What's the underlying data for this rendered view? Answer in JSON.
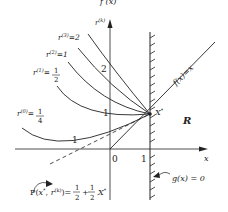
{
  "figure": {
    "top_caption_fragment": "f (x)",
    "axes": {
      "y_label": "r(k)",
      "x_label": "x",
      "origin_label": "0",
      "x_tick_1": "1"
    },
    "curves": [
      {
        "label": "r(3)=2",
        "r": "2"
      },
      {
        "label": "r(2)=1",
        "r": "1"
      },
      {
        "label": "r(1)=1/2",
        "r": "1/2"
      },
      {
        "label": "r(0)=1/4",
        "r": "1/4"
      }
    ],
    "y_axis_marks": [
      "2",
      "1"
    ],
    "min_point_label": "1",
    "objective_line_label": "f(x)=x",
    "optimum_label": "X*",
    "region_label": "R",
    "constraint_label": "g(x) = 0",
    "penalty_formula": "P(x*, r(k))= 1/2 + 1/2 X*",
    "colors": {
      "ink": "#222222",
      "background": "#ffffff"
    }
  }
}
